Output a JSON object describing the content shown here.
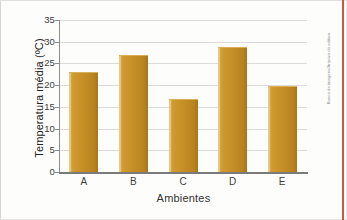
{
  "figure": {
    "credit": "Banco de imagens/Arquivo da editora",
    "bar_color": "#C8912B",
    "grid_color": "#DCDCDC",
    "axis_color": "#7A7A7A",
    "accent_rule_color": "#C0392B"
  },
  "chart_data": {
    "type": "bar",
    "title": "",
    "xlabel": "Ambientes",
    "ylabel": "Temperatura média (ºC)",
    "categories": [
      "A",
      "B",
      "C",
      "D",
      "E"
    ],
    "values": [
      22.7,
      26.7,
      16.5,
      28.5,
      19.5
    ],
    "series": [
      {
        "name": "Temperatura média",
        "values": [
          22.7,
          26.7,
          16.5,
          28.5,
          19.5
        ],
        "color": "#C8912B"
      }
    ],
    "ylim": [
      0,
      35
    ],
    "ytick_step": 5,
    "ytick_labels": [
      "0",
      "5",
      "10",
      "15",
      "20",
      "25",
      "30",
      "35"
    ],
    "ytick_values": [
      0,
      5,
      10,
      15,
      20,
      25,
      30,
      35
    ],
    "grid": "horizontal",
    "legend": "none",
    "legend_position": "none"
  }
}
